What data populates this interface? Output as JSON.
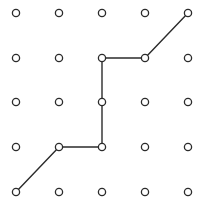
{
  "diagram": {
    "type": "lattice-path",
    "grid": {
      "cols": 5,
      "rows": 5,
      "x_positions": [
        16,
        59,
        102,
        145,
        188
      ],
      "y_positions": [
        13,
        58,
        102,
        147,
        192
      ],
      "node_radius": 3.6
    },
    "path": [
      {
        "col": 0,
        "row": 4
      },
      {
        "col": 1,
        "row": 3
      },
      {
        "col": 2,
        "row": 3
      },
      {
        "col": 2,
        "row": 2
      },
      {
        "col": 2,
        "row": 1
      },
      {
        "col": 3,
        "row": 1
      },
      {
        "col": 4,
        "row": 0
      }
    ],
    "colors": {
      "node_stroke": "#2b2b2b",
      "node_fill": "#ffffff",
      "edge": "#2b2b2b",
      "background": "#ffffff"
    }
  }
}
